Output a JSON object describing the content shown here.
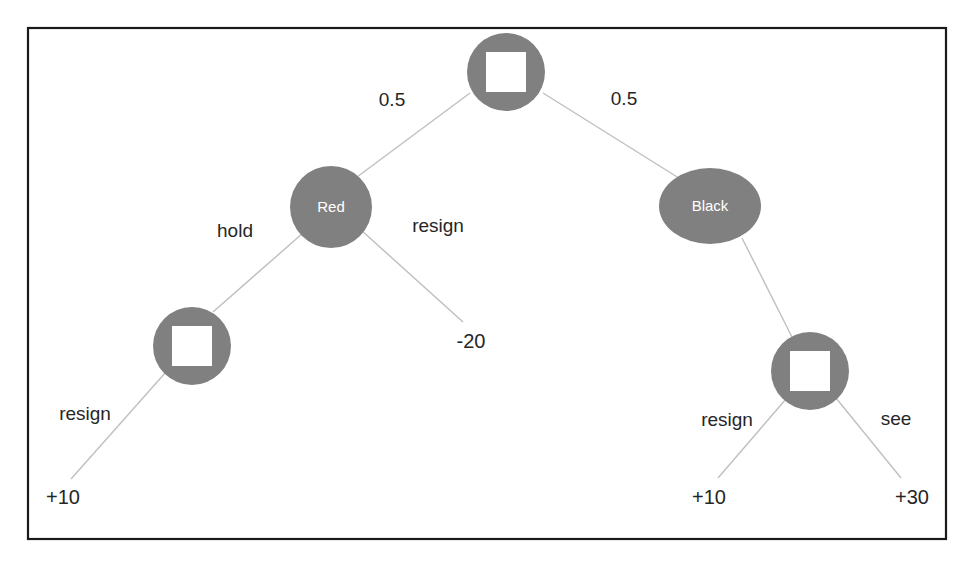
{
  "diagram": {
    "type": "extensive-form-game-tree",
    "frame": {
      "x": 28,
      "y": 28,
      "width": 918,
      "height": 511,
      "border_color": "#1a1a1a"
    },
    "colors": {
      "node_fill": "#808080",
      "node_inner": "#ffffff",
      "edge_line": "#bfbfbf",
      "label_text": "#262626",
      "node_text": "#ffffff"
    },
    "nodes": [
      {
        "id": "root",
        "kind": "chance",
        "shape": "circle-with-square",
        "label": "",
        "cx": 506,
        "cy": 72,
        "r": 39,
        "square": 40
      },
      {
        "id": "red",
        "kind": "player",
        "shape": "circle",
        "label": "Red",
        "cx": 331,
        "cy": 207,
        "r": 41
      },
      {
        "id": "black",
        "kind": "player",
        "shape": "ellipse",
        "label": "Black",
        "cx": 710,
        "cy": 206,
        "rx": 51,
        "ry": 38
      },
      {
        "id": "left-decision",
        "kind": "decision",
        "shape": "circle-with-square",
        "label": "",
        "cx": 192,
        "cy": 346,
        "r": 39,
        "square": 40
      },
      {
        "id": "right-decision",
        "kind": "decision",
        "shape": "circle-with-square",
        "label": "",
        "cx": 810,
        "cy": 371,
        "r": 39,
        "square": 40
      }
    ],
    "edges": [
      {
        "id": "root-red",
        "from": "root",
        "to": "red",
        "label": "0.5",
        "label_x": 392,
        "label_y": 101,
        "x1": 470,
        "y1": 93,
        "x2": 357,
        "y2": 177
      },
      {
        "id": "root-black",
        "from": "root",
        "to": "black",
        "label": "0.5",
        "label_x": 624,
        "label_y": 100,
        "x1": 543,
        "y1": 93,
        "x2": 682,
        "y2": 180
      },
      {
        "id": "red-hold",
        "from": "red",
        "to": "left-decision",
        "label": "hold",
        "label_x": 235,
        "label_y": 232,
        "x1": 303,
        "y1": 233,
        "x2": 213,
        "y2": 312
      },
      {
        "id": "red-resign",
        "from": "red",
        "to": "payoff-minus20",
        "label": "resign",
        "label_x": 438,
        "label_y": 227,
        "x1": 361,
        "y1": 230,
        "x2": 463,
        "y2": 322
      },
      {
        "id": "left-resign",
        "from": "left-decision",
        "to": "payoff-plus10-left",
        "label": "resign",
        "label_x": 85,
        "label_y": 415,
        "x1": 166,
        "y1": 372,
        "x2": 71,
        "y2": 479
      },
      {
        "id": "black-right",
        "from": "black",
        "to": "right-decision",
        "label": "",
        "x1": 742,
        "y1": 238,
        "x2": 792,
        "y2": 337
      },
      {
        "id": "right-resign",
        "from": "right-decision",
        "to": "payoff-plus10-right",
        "label": "resign",
        "label_x": 727,
        "label_y": 421,
        "x1": 786,
        "y1": 399,
        "x2": 718,
        "y2": 478
      },
      {
        "id": "right-see",
        "from": "right-decision",
        "to": "payoff-plus30",
        "label": "see",
        "label_x": 896,
        "label_y": 420,
        "x1": 836,
        "y1": 398,
        "x2": 901,
        "y2": 478
      }
    ],
    "payoffs": [
      {
        "id": "payoff-plus10-left",
        "value": "+10",
        "x": 63,
        "y": 499
      },
      {
        "id": "payoff-minus20",
        "value": "-20",
        "x": 471,
        "y": 343
      },
      {
        "id": "payoff-plus10-right",
        "value": "+10",
        "x": 709,
        "y": 499
      },
      {
        "id": "payoff-plus30",
        "value": "+30",
        "x": 912,
        "y": 499
      }
    ]
  }
}
